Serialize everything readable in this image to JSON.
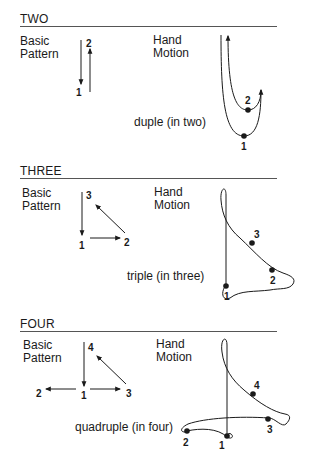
{
  "sections": [
    {
      "title": "TWO",
      "basic_label_1": "Basic",
      "basic_label_2": "Pattern",
      "hand_label_1": "Hand",
      "hand_label_2": "Motion",
      "caption": "duple (in two)",
      "beats": [
        "1",
        "2"
      ]
    },
    {
      "title": "THREE",
      "basic_label_1": "Basic",
      "basic_label_2": "Pattern",
      "hand_label_1": "Hand",
      "hand_label_2": "Motion",
      "caption": "triple (in three)",
      "beats": [
        "1",
        "2",
        "3"
      ]
    },
    {
      "title": "FOUR",
      "basic_label_1": "Basic",
      "basic_label_2": "Pattern",
      "hand_label_1": "Hand",
      "hand_label_2": "Motion",
      "caption": "quadruple (in four)",
      "beats": [
        "1",
        "2",
        "3",
        "4"
      ]
    }
  ]
}
